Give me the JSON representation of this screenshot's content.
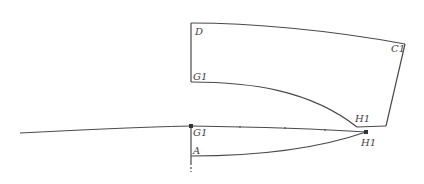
{
  "diagram": {
    "type": "pattern-draft",
    "stroke_color": "#4a4a4a",
    "labels": {
      "D": "D",
      "C1": "C1",
      "G1_top": "G1",
      "H1_upper": "H1",
      "G1_bottom": "G1",
      "A": "A",
      "H1_lower": "H1"
    }
  }
}
